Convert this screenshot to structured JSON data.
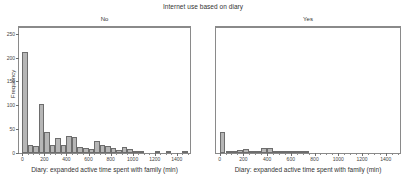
{
  "chart_data": {
    "type": "bar",
    "title": "Internet use based on diary",
    "xlabel": "Diary: expanded active time spent with family (min)",
    "ylabel": "Frequency",
    "grid": false,
    "legend": null,
    "binwidth": 50,
    "xlim": [
      -30,
      1520
    ],
    "ylim": [
      0,
      262
    ],
    "xticks": [
      0,
      200,
      400,
      600,
      800,
      1000,
      1200,
      1400
    ],
    "xticklabels": [
      "0",
      "200",
      "400",
      "600",
      "800",
      "1000",
      "1200",
      "1400"
    ],
    "yticks": [
      0,
      50,
      100,
      150,
      200,
      250
    ],
    "yticklabels": [
      "0",
      "50",
      "100",
      "150",
      "200",
      "250"
    ],
    "panels": [
      {
        "label": "No",
        "bin_starts": [
          0,
          50,
          100,
          150,
          200,
          250,
          300,
          350,
          400,
          450,
          500,
          550,
          600,
          650,
          700,
          750,
          800,
          850,
          900,
          950,
          1000,
          1050,
          1100,
          1150,
          1200,
          1250,
          1300,
          1350,
          1400,
          1450
        ],
        "values": [
          212,
          16,
          15,
          102,
          45,
          16,
          32,
          16,
          35,
          34,
          12,
          11,
          9,
          25,
          16,
          15,
          10,
          7,
          12,
          8,
          3,
          5,
          0,
          0,
          2,
          0,
          1,
          0,
          0,
          1
        ]
      },
      {
        "label": "Yes",
        "bin_starts": [
          0,
          50,
          100,
          150,
          200,
          250,
          300,
          350,
          400,
          450,
          500,
          550,
          600,
          650,
          700,
          750,
          800,
          850,
          900,
          950,
          1000,
          1050,
          1100,
          1150,
          1200,
          1250,
          1300,
          1350,
          1400,
          1450
        ],
        "values": [
          45,
          4,
          3,
          7,
          8,
          5,
          2,
          10,
          11,
          4,
          3,
          2,
          3,
          3,
          1,
          0,
          0,
          0,
          0,
          0,
          0,
          0,
          0,
          0,
          0,
          0,
          0,
          0,
          0,
          0
        ]
      }
    ],
    "colors": {
      "bar_fill": "#b6b6b6",
      "bar_edge": "#6d6d6d",
      "axis": "#8a8a8a",
      "text": "#333333"
    }
  }
}
